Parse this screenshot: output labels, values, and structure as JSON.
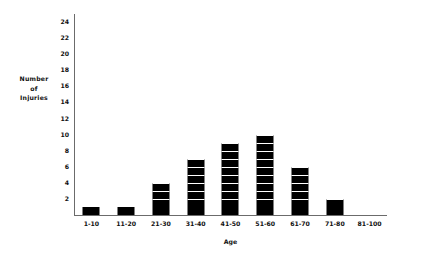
{
  "chart_data": {
    "type": "bar",
    "title": "",
    "xlabel": "Age",
    "ylabel": "Number of Injuries",
    "ylabel_lines": [
      "Number",
      "of",
      "Injuries"
    ],
    "categories": [
      "1-10",
      "11-20",
      "21-30",
      "31-40",
      "41-50",
      "51-60",
      "61-70",
      "71-80",
      "81-100"
    ],
    "values": [
      1,
      1,
      4,
      7,
      9,
      10,
      6,
      2,
      0
    ],
    "ylim": [
      0,
      25
    ],
    "yticks": [
      2,
      4,
      6,
      8,
      10,
      12,
      14,
      16,
      18,
      20,
      22,
      24
    ],
    "ytick_labels": [
      "2",
      "4",
      "6",
      "8",
      "10",
      "12",
      "14",
      "16",
      "18",
      "20",
      "22",
      "24"
    ],
    "grid": false,
    "legend": null,
    "bar_style": "stacked-unit-blocks",
    "bar_color": "#000000",
    "axis_color": "#6b6b6b",
    "background_color": "#ffffff"
  }
}
